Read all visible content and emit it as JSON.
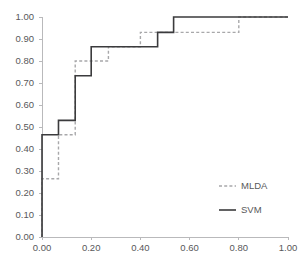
{
  "chart_data": {
    "type": "line",
    "title": "",
    "xlabel": "",
    "ylabel": "",
    "xlim": [
      0.0,
      1.0
    ],
    "ylim": [
      0.0,
      1.0
    ],
    "grid": false,
    "legend_position": "center-right",
    "xticks": [
      "0.00",
      "0.20",
      "0.40",
      "0.60",
      "0.80",
      "1.00"
    ],
    "xtick_values": [
      0.0,
      0.2,
      0.4,
      0.6,
      0.8,
      1.0
    ],
    "yticks": [
      "0.00",
      "0.10",
      "0.20",
      "0.30",
      "0.40",
      "0.50",
      "0.60",
      "0.70",
      "0.80",
      "0.90",
      "1.00"
    ],
    "ytick_values": [
      0.0,
      0.1,
      0.2,
      0.3,
      0.4,
      0.5,
      0.6,
      0.7,
      0.8,
      0.9,
      1.0
    ],
    "series": [
      {
        "name": "MLDA",
        "style": "dashed",
        "color": "#a8a8aa",
        "points": [
          [
            0.0,
            0.0
          ],
          [
            0.0,
            0.265
          ],
          [
            0.067,
            0.265
          ],
          [
            0.067,
            0.465
          ],
          [
            0.135,
            0.465
          ],
          [
            0.135,
            0.8
          ],
          [
            0.27,
            0.8
          ],
          [
            0.27,
            0.865
          ],
          [
            0.4,
            0.865
          ],
          [
            0.4,
            0.93
          ],
          [
            0.8,
            0.93
          ],
          [
            0.8,
            1.0
          ],
          [
            1.0,
            1.0
          ]
        ]
      },
      {
        "name": "SVM",
        "style": "solid",
        "color": "#3b3b3d",
        "points": [
          [
            0.0,
            0.0
          ],
          [
            0.0,
            0.465
          ],
          [
            0.067,
            0.465
          ],
          [
            0.067,
            0.53
          ],
          [
            0.135,
            0.53
          ],
          [
            0.135,
            0.733
          ],
          [
            0.2,
            0.733
          ],
          [
            0.2,
            0.865
          ],
          [
            0.47,
            0.865
          ],
          [
            0.47,
            0.93
          ],
          [
            0.535,
            0.93
          ],
          [
            0.535,
            1.0
          ],
          [
            1.0,
            1.0
          ]
        ]
      }
    ],
    "legend": [
      {
        "label": "MLDA",
        "style": "dashed",
        "color": "#a8a8aa"
      },
      {
        "label": "SVM",
        "style": "solid",
        "color": "#3b3b3d"
      }
    ]
  }
}
